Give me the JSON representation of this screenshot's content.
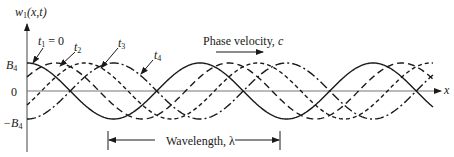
{
  "figure": {
    "y_axis_label": "w",
    "y_axis_label_sub": "1",
    "y_axis_label_args": "(x,t)",
    "x_axis_label": "x",
    "y_ticks": [
      {
        "label": "B",
        "sub": "4",
        "value": 1
      },
      {
        "label": "0",
        "sub": "",
        "value": 0
      },
      {
        "label": "−B",
        "sub": "4",
        "value": -1
      }
    ],
    "curve_labels": [
      {
        "label": "t",
        "sub": "1",
        "suffix": " = 0"
      },
      {
        "label": "t",
        "sub": "2",
        "suffix": ""
      },
      {
        "label": "t",
        "sub": "3",
        "suffix": ""
      },
      {
        "label": "t",
        "sub": "4",
        "suffix": ""
      }
    ],
    "phase_velocity_label": "Phase velocity, ",
    "phase_velocity_symbol": "c",
    "wavelength_label": "Wavelength, λ"
  },
  "chart_data": {
    "type": "line",
    "title": "",
    "xlabel": "x",
    "ylabel": "w1(x,t)",
    "ylim": [
      -1,
      1
    ],
    "y_ticks": [
      "-B4",
      "0",
      "B4"
    ],
    "wavelength_px": 173,
    "x_range_in_wavelengths": [
      0,
      2.35
    ],
    "series": [
      {
        "name": "t1 = 0",
        "style": "solid",
        "phase_shift_wavelengths": 0.0
      },
      {
        "name": "t2",
        "style": "long-dash",
        "phase_shift_wavelengths": 0.1667
      },
      {
        "name": "t3",
        "style": "short-dash",
        "phase_shift_wavelengths": 0.3333
      },
      {
        "name": "t4",
        "style": "dash-dot",
        "phase_shift_wavelengths": 0.5
      }
    ],
    "annotations": [
      "Phase velocity, c (arrow pointing +x)",
      "Wavelength, λ (bracket spanning one period)"
    ],
    "grid": false,
    "legend": "inline arrow labels"
  },
  "render": {
    "origin_x": 27,
    "zero_y": 91,
    "amplitude_px": 28,
    "x_end": 433,
    "line_color": "#1a1a1a",
    "axis_color": "#777777"
  }
}
